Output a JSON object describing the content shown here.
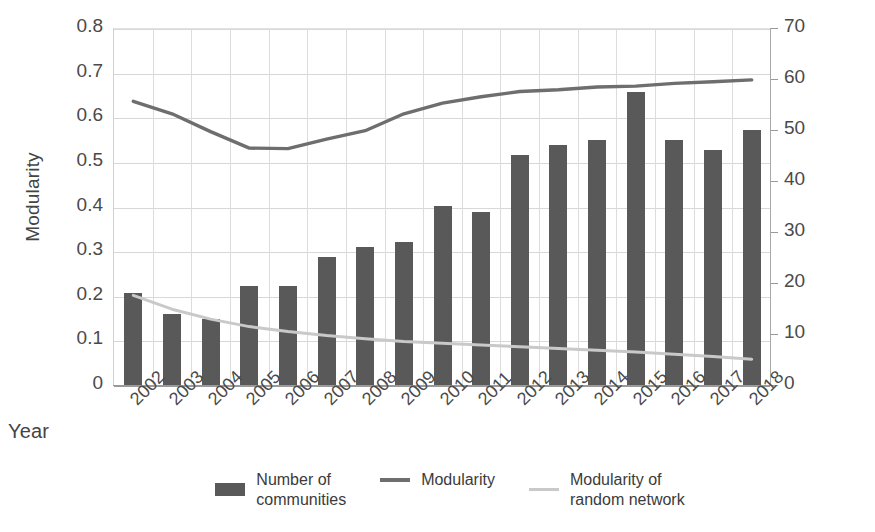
{
  "chart_data": {
    "type": "bar",
    "title": "",
    "xlabel": "Year",
    "ylabel": "Modularity",
    "y2label": "Number of communities",
    "categories": [
      "2002",
      "2003",
      "2004",
      "2005",
      "2006",
      "2007",
      "2008",
      "2009",
      "2010",
      "2011",
      "2012",
      "2013",
      "2014",
      "2015",
      "2016",
      "2017",
      "2018"
    ],
    "ylim": [
      0,
      0.8
    ],
    "y2lim": [
      0,
      70
    ],
    "yticks": [
      "0",
      "0.1",
      "0.2",
      "0.3",
      "0.4",
      "0.5",
      "0.6",
      "0.7",
      "0.8"
    ],
    "ytick_values": [
      0,
      0.1,
      0.2,
      0.3,
      0.4,
      0.5,
      0.6,
      0.7,
      0.8
    ],
    "y2ticks": [
      "0",
      "10",
      "20",
      "30",
      "40",
      "50",
      "60",
      "70"
    ],
    "y2tick_values": [
      0,
      10,
      20,
      30,
      40,
      50,
      60,
      70
    ],
    "grid": true,
    "legend_position": "bottom",
    "series": [
      {
        "name": "Number of communities",
        "type": "bar",
        "axis": "right",
        "color": "#595959",
        "values": [
          18,
          14,
          13,
          19.5,
          19.5,
          25,
          27,
          28,
          35,
          34,
          45,
          47,
          48,
          57.5,
          48,
          46,
          50
        ]
      },
      {
        "name": "Modularity",
        "type": "line",
        "axis": "left",
        "color": "#6e6e6e",
        "values": [
          0.638,
          0.61,
          0.57,
          0.533,
          0.532,
          0.553,
          0.572,
          0.61,
          0.634,
          0.648,
          0.66,
          0.664,
          0.67,
          0.672,
          0.678,
          0.682,
          0.686
        ]
      },
      {
        "name": "Modularity of random network",
        "type": "line",
        "axis": "left",
        "color": "#c9c9c9",
        "values": [
          0.203,
          0.172,
          0.15,
          0.133,
          0.122,
          0.113,
          0.106,
          0.1,
          0.096,
          0.092,
          0.088,
          0.084,
          0.08,
          0.076,
          0.071,
          0.066,
          0.06
        ]
      }
    ]
  },
  "legend": {
    "items": [
      {
        "label": "Number of\ncommunities",
        "line1": "Number of",
        "line2": "communities",
        "marker": "bar-swatch",
        "color": "#595959"
      },
      {
        "label": "Modularity",
        "line1": "Modularity",
        "line2": "",
        "marker": "line-swatch",
        "color": "#6e6e6e"
      },
      {
        "label": "Modularity of\nrandom network",
        "line1": "Modularity of",
        "line2": "random network",
        "marker": "line-swatch-light",
        "color": "#c9c9c9"
      }
    ]
  },
  "axes": {
    "left_title": "Modularity",
    "right_title": "Number of communities",
    "x_title": "Year"
  },
  "colors": {
    "bar": "#595959",
    "modularity_line": "#6e6e6e",
    "random_line": "#c9c9c9",
    "grid": "#d8d8d8",
    "axis": "#9a9a9a",
    "text": "#3b3b3b",
    "background": "#ffffff"
  }
}
